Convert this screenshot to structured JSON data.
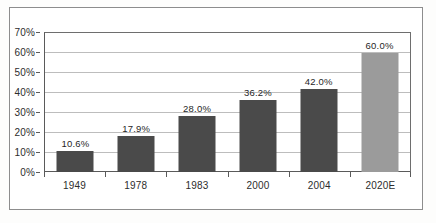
{
  "chart_data": {
    "type": "bar",
    "title": "",
    "subtitle": "",
    "xlabel": "",
    "ylabel": "",
    "categories": [
      "1949",
      "1978",
      "1983",
      "2000",
      "2004",
      "2020E"
    ],
    "values": [
      10.6,
      17.9,
      28.0,
      36.2,
      42.0,
      60.0
    ],
    "data_labels": [
      "10.6%",
      "17.9%",
      "28.0%",
      "36.2%",
      "42.0%",
      "60.0%"
    ],
    "ylim": [
      0,
      70
    ],
    "ytick_values": [
      0,
      10,
      20,
      30,
      40,
      50,
      60,
      70
    ],
    "ytick_labels": [
      "0%",
      "10%",
      "20%",
      "30%",
      "40%",
      "50%",
      "60%",
      "70%"
    ],
    "grid": true,
    "legend": "none",
    "series": [
      {
        "name": "",
        "values": [
          10.6,
          17.9,
          28.0,
          36.2,
          42.0,
          60.0
        ]
      }
    ],
    "bar_colors": [
      "#4a4a4a",
      "#4a4a4a",
      "#4a4a4a",
      "#4a4a4a",
      "#4a4a4a",
      "#9b9b9b"
    ],
    "colors": {
      "bar_actual": "#4a4a4a",
      "bar_estimate": "#9b9b9b",
      "gridline": "#bdbdbd",
      "axis": "#5a5a5a",
      "frame": "#8d8d8d",
      "text": "#2d2d2d",
      "plot_background": "#ffffff"
    }
  }
}
